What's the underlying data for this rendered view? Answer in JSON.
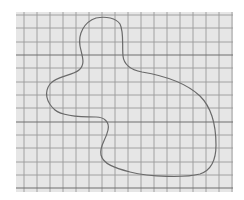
{
  "figure": {
    "background_color": "#ffffff",
    "paper_color": "#e6e6e6",
    "grid_line_color": "#9a9a9a",
    "grid_major_color": "#6e6e6e",
    "outline_color": "#6a6a6a",
    "grid": {
      "x0": 16,
      "y0": 12,
      "x1": 233,
      "y1": 192,
      "vertical_lines": [
        24,
        37,
        50,
        63,
        76,
        89,
        102,
        115,
        128,
        141,
        154,
        167,
        180,
        193,
        206,
        219,
        232
      ],
      "horizontal_lines": [
        15,
        28,
        42,
        55,
        68,
        82,
        95,
        108,
        122,
        135,
        148,
        162,
        175,
        188
      ],
      "major_horizontal_lines": [
        55,
        122,
        188
      ]
    },
    "outline_path": "M 96 18 C 106 16, 116 18, 120 24 C 124 32, 122 44, 123 56 C 124 66, 132 70, 142 72 C 160 75, 185 82, 200 96 C 212 108, 216 125, 216 145 C 216 160, 212 170, 200 174 C 185 178, 150 177, 130 172 C 115 168, 103 164, 101 155 C 99 146, 106 140, 108 130 C 110 122, 104 117, 96 117 C 82 117, 62 116, 55 110 C 46 102, 44 92, 50 84 C 56 76, 72 76, 79 70 C 86 64, 82 56, 80 46 C 78 34, 84 22, 96 18 Z"
  }
}
